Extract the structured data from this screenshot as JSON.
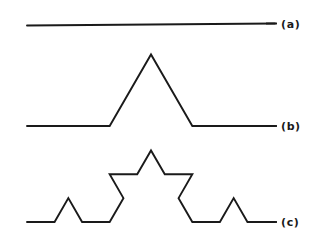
{
  "figure": {
    "kind": "koch-curve-construction",
    "background_color": "#ffffff",
    "stroke_color": "#1a1a1a",
    "stroke_width": 1.9,
    "width": 322,
    "height": 247,
    "panels": [
      {
        "id": "a",
        "label": "(a)",
        "label_x": 281,
        "label_y": 29,
        "iteration": 0,
        "segment_count": 1,
        "baseline_y": 25.5,
        "start_x": 27,
        "end_x": 275,
        "tilt_y_right": 23.5,
        "points": "27,25.5 275,23.5"
      },
      {
        "id": "b",
        "label": "(b)",
        "label_x": 281,
        "label_y": 129,
        "iteration": 1,
        "segment_count": 4,
        "baseline_y": 126,
        "start_x": 27,
        "end_x": 275,
        "apex_x": 151,
        "apex_y": 54.4,
        "points": "27,126 110.3,126 151,54.4 191.7,126 275,126"
      },
      {
        "id": "c",
        "label": "(c)",
        "label_x": 281,
        "label_y": 225,
        "iteration": 2,
        "segment_count": 16,
        "baseline_y": 222,
        "start_x": 27,
        "end_x": 275,
        "apex_x": 151,
        "apex_y": 150.4,
        "points": "27,222 54.8,222 68.6,198.2 82.4,222 110.3,222 124.1,198.2 151.9,198.2 151,150.4 137.1,174.2 124.1,198.2 110.3,222 137.1,222 151,198.2 165.8,222 191.7,222 179.8,198.2 151.9,198.2"
      }
    ],
    "label_tick_x1": 266,
    "label_tick_x2": 277
  }
}
